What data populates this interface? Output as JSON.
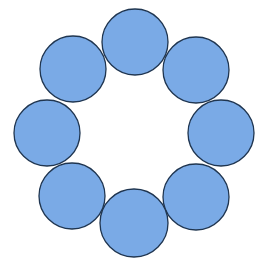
{
  "diagram": {
    "type": "ring-of-circles",
    "width": 266,
    "height": 269,
    "background": "#ffffff",
    "fill_color": "#7aaae6",
    "stroke_color": "#1f3550",
    "stroke_width": 1.3,
    "circle_count": 8,
    "circles": [
      {
        "name": "circle-top",
        "cx": 135,
        "cy": 42,
        "r": 33
      },
      {
        "name": "circle-top-right",
        "cx": 196,
        "cy": 70,
        "r": 33
      },
      {
        "name": "circle-right",
        "cx": 221,
        "cy": 133,
        "r": 33
      },
      {
        "name": "circle-bottom-right",
        "cx": 196,
        "cy": 197,
        "r": 33
      },
      {
        "name": "circle-bottom",
        "cx": 134,
        "cy": 223,
        "r": 34
      },
      {
        "name": "circle-bottom-left",
        "cx": 72,
        "cy": 196,
        "r": 33
      },
      {
        "name": "circle-left",
        "cx": 47,
        "cy": 133,
        "r": 33
      },
      {
        "name": "circle-top-left",
        "cx": 73,
        "cy": 69,
        "r": 33
      }
    ]
  }
}
